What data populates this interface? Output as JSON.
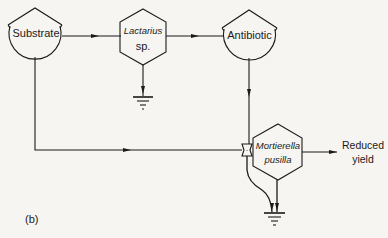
{
  "diagram": {
    "panel_label": "(b)",
    "colors": {
      "stroke": "#1a1a1a",
      "background": "#f6f5f1"
    },
    "nodes": [
      {
        "id": "substrate",
        "shape": "storage-tank",
        "label": "Substrate"
      },
      {
        "id": "lactarius",
        "shape": "hexagon",
        "label_line1": "Lactarius",
        "label_line2": "sp."
      },
      {
        "id": "antibiotic",
        "shape": "storage-tank",
        "label": "Antibiotic"
      },
      {
        "id": "mortierella",
        "shape": "hexagon",
        "label_line1": "Mortierella",
        "label_line2": "pusilla"
      },
      {
        "id": "workgate",
        "shape": "workgate"
      },
      {
        "id": "sink1",
        "shape": "heat-sink"
      },
      {
        "id": "sink2",
        "shape": "heat-sink"
      }
    ],
    "edges": [
      {
        "from": "substrate",
        "to": "lactarius"
      },
      {
        "from": "lactarius",
        "to": "antibiotic"
      },
      {
        "from": "lactarius",
        "to": "sink1"
      },
      {
        "from": "antibiotic",
        "to": "workgate"
      },
      {
        "from": "substrate",
        "to": "workgate"
      },
      {
        "from": "workgate",
        "to": "mortierella"
      },
      {
        "from": "workgate",
        "to": "sink2"
      },
      {
        "from": "mortierella",
        "to": "sink2"
      },
      {
        "from": "mortierella",
        "to": "output"
      }
    ],
    "output": {
      "line1": "Reduced",
      "line2": "yield"
    }
  }
}
